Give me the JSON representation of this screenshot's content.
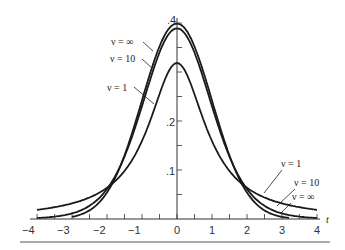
{
  "chart_data": {
    "type": "line",
    "title": "",
    "xlabel": "t",
    "ylabel": "",
    "xlim": [
      -4,
      4
    ],
    "ylim": [
      0,
      0.4
    ],
    "grid": false,
    "x_ticks": [
      -4,
      -3,
      -2,
      -1,
      0,
      1,
      2,
      3,
      4
    ],
    "x_tick_labels": [
      "−4",
      "−3",
      "−2",
      "−1",
      "0",
      "1",
      "2",
      "3",
      "4"
    ],
    "y_ticks": [
      0.1,
      0.2,
      0.4
    ],
    "y_tick_labels": [
      ".1",
      ".2",
      ".4"
    ],
    "y_minor_ticks": [
      0.05,
      0.15,
      0.25,
      0.3,
      0.35
    ],
    "series": [
      {
        "name": "ν = ∞",
        "nu": "inf",
        "x": [
          -3,
          -2,
          -1,
          0,
          1,
          2,
          3
        ],
        "values": [
          0.004,
          0.054,
          0.242,
          0.399,
          0.242,
          0.054,
          0.004
        ]
      },
      {
        "name": "ν = 10",
        "nu": 10,
        "x": [
          -4,
          -3,
          -2,
          -1,
          0,
          1,
          2,
          3,
          4
        ],
        "values": [
          0.002,
          0.011,
          0.061,
          0.23,
          0.389,
          0.23,
          0.061,
          0.011,
          0.002
        ]
      },
      {
        "name": "ν = 1",
        "nu": 1,
        "x": [
          -4,
          -3,
          -2,
          -1,
          0,
          1,
          2,
          3,
          4
        ],
        "values": [
          0.019,
          0.032,
          0.064,
          0.159,
          0.318,
          0.159,
          0.064,
          0.032,
          0.019
        ]
      }
    ],
    "annotations": {
      "left": [
        "ν = ∞",
        "ν = 10",
        "ν = 1"
      ],
      "right": [
        "ν = 1",
        "ν = 10",
        "ν = ∞"
      ]
    }
  },
  "labels": {
    "axis_t": "t",
    "left_inf": "ν = ∞",
    "left_10": "ν = 10",
    "left_1": "ν = 1",
    "right_1": "ν = 1",
    "right_10": "ν = 10",
    "right_inf": "ν = ∞",
    "y4": ".4",
    "y2": ".2",
    "y1": ".1",
    "xm4": "−4",
    "xm3": "−3",
    "xm2": "−2",
    "xm1": "−1",
    "x0": "0",
    "x1": "1",
    "x2": "2",
    "x3": "3",
    "x4": "4"
  }
}
